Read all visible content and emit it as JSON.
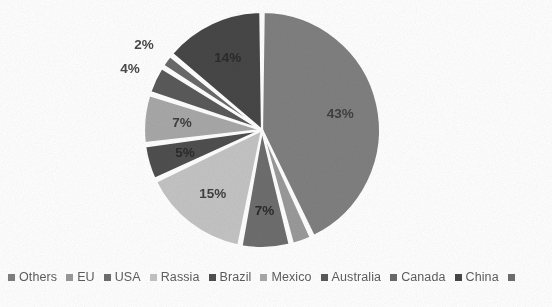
{
  "chart_data": {
    "type": "pie",
    "title": "",
    "subtitle": "",
    "xlabel": "",
    "ylabel": "",
    "legend_position": "bottom",
    "grid": false,
    "units": "percent",
    "total": 100,
    "categories": [
      "Others",
      "EU",
      "USA",
      "Rassia",
      "Brazil",
      "Mexico",
      "Australia",
      "Canada",
      "China"
    ],
    "values": [
      43,
      3,
      7,
      15,
      5,
      7,
      4,
      2,
      14
    ],
    "labels": [
      "43%",
      "3%",
      "7%",
      "15%",
      "5%",
      "7%",
      "4%",
      "2%",
      "14%"
    ],
    "colors": [
      "#808080",
      "#9a9a9a",
      "#6e6e6e",
      "#c4c4c4",
      "#4f4f4f",
      "#a8a8a8",
      "#5a5a5a",
      "#6a6a6a",
      "#474747"
    ],
    "label_placement": [
      "inside",
      "outside",
      "inside",
      "inside",
      "inside",
      "inside",
      "outside",
      "outside",
      "inside"
    ],
    "slices": [
      {
        "name": "Others",
        "value": 43,
        "label": "43%",
        "color": "#808080",
        "placement": "inside",
        "tone": "light"
      },
      {
        "name": "EU",
        "value": 3,
        "label": "3%",
        "color": "#9a9a9a",
        "placement": "outside",
        "tone": "light"
      },
      {
        "name": "USA",
        "value": 7,
        "label": "7%",
        "color": "#6e6e6e",
        "placement": "inside",
        "tone": "dark"
      },
      {
        "name": "Rassia",
        "value": 15,
        "label": "15%",
        "color": "#c4c4c4",
        "placement": "inside",
        "tone": "light"
      },
      {
        "name": "Brazil",
        "value": 5,
        "label": "5%",
        "color": "#4f4f4f",
        "placement": "inside",
        "tone": "dark"
      },
      {
        "name": "Mexico",
        "value": 7,
        "label": "7%",
        "color": "#a8a8a8",
        "placement": "inside",
        "tone": "light"
      },
      {
        "name": "Australia",
        "value": 4,
        "label": "4%",
        "color": "#5a5a5a",
        "placement": "outside",
        "tone": "dark"
      },
      {
        "name": "Canada",
        "value": 2,
        "label": "2%",
        "color": "#6a6a6a",
        "placement": "outside",
        "tone": "dark"
      },
      {
        "name": "China",
        "value": 14,
        "label": "14%",
        "color": "#474747",
        "placement": "inside",
        "tone": "dark"
      }
    ],
    "start_angle_deg": 0,
    "direction": "clockwise",
    "center": {
      "x": 262,
      "y": 130
    },
    "radius": 118,
    "slice_gap_deg": 1.6,
    "slice_border_color": "#ffffff"
  },
  "legend": {
    "items": [
      {
        "label": "Others",
        "color": "#808080"
      },
      {
        "label": "EU",
        "color": "#9a9a9a"
      },
      {
        "label": "USA",
        "color": "#6e6e6e"
      },
      {
        "label": "Rassia",
        "color": "#c4c4c4"
      },
      {
        "label": "Brazil",
        "color": "#4f4f4f"
      },
      {
        "label": "Mexico",
        "color": "#a8a8a8"
      },
      {
        "label": "Australia",
        "color": "#5a5a5a"
      },
      {
        "label": "Canada",
        "color": "#6a6a6a"
      },
      {
        "label": "China",
        "color": "#474747"
      },
      {
        "label": "",
        "color": "#6e6e6e"
      }
    ]
  }
}
